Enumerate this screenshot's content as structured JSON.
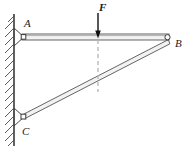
{
  "figure": {
    "type": "statics-free-body-diagram",
    "background_color": "#ffffff"
  },
  "labels": {
    "point_a": "A",
    "point_b": "B",
    "point_c": "C",
    "force": "F"
  },
  "colors": {
    "member_outline": "#555555",
    "member_fill": "#f2f2f2",
    "wall_line": "#3a3a3a",
    "hatch": "#4a4a4a",
    "dashed_guide": "#b0b0b0",
    "force_arrow": "#111111",
    "pin_fill": "#ffffff",
    "bracket_outline": "#4a4a4a"
  },
  "geometry": {
    "wall_x": 14,
    "wall_top": 14,
    "wall_bottom": 146,
    "point_a": {
      "x": 22,
      "y": 37
    },
    "point_b": {
      "x": 168,
      "y": 42
    },
    "point_c": {
      "x": 22,
      "y": 117
    },
    "beam_thickness": 6,
    "strut_thickness": 5,
    "force_x": 98,
    "force_arrow_top": 12,
    "force_arrow_tip": 38,
    "dashed_guide_top": 40,
    "dashed_guide_bottom": 92
  },
  "annotations": {
    "force_direction": "downward",
    "load_position_note": "F acts vertically downward on beam AB",
    "dashed_line_note": "vertical construction line from load point down to strut CB"
  }
}
